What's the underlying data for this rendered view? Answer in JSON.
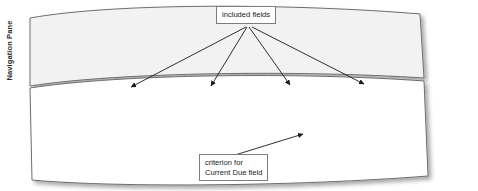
{
  "window": {
    "navigation_pane_label": "Navigation Pane",
    "field_list_title": "Account Manager ..."
  },
  "qbe_grid": {
    "row_labels": [
      "Field:",
      "Table:",
      "Sort:",
      "Show:",
      "Criteria:",
      "or:"
    ],
    "columns": [
      {
        "field": "Account Number",
        "table": "Account",
        "sort": "",
        "show": true,
        "criteria": "",
        "or": ""
      },
      {
        "field": "Account Name",
        "table": "Account",
        "sort": "",
        "show": true,
        "criteria": "",
        "or": ""
      },
      {
        "field": "Amount Paid",
        "table": "Account",
        "sort": "",
        "show": true,
        "criteria": "",
        "or": ""
      },
      {
        "field": "Current Due",
        "table": "Account",
        "sort": "",
        "show": true,
        "criteria": "d",
        "or": ""
      },
      {
        "field": "",
        "table": "",
        "sort": "",
        "show": false,
        "criteria": "",
        "or": ""
      }
    ],
    "checked_glyph": "✓"
  },
  "callouts": {
    "included_fields": "included fields",
    "criterion_line1": "criterion for",
    "criterion_line2": "Current Due field"
  },
  "cursor": {
    "ibeam_glyph": "I"
  },
  "splitter": {
    "arrow_direction": "left"
  },
  "colors": {
    "pane_background": "#f0f0f0",
    "grid_line": "#cfcfcf",
    "border": "#9e9e9e",
    "callout_border": "#7d7d7d",
    "text": "#1d1d1d"
  }
}
